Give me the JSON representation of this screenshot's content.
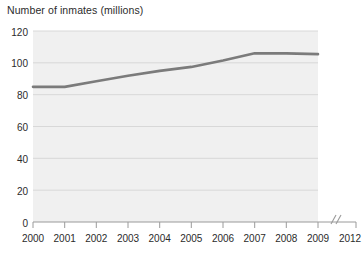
{
  "chart_data": {
    "type": "line",
    "title": "Number of inmates (millions)",
    "xlabel": "",
    "ylabel": "",
    "ylim": [
      0,
      120
    ],
    "ytick_labels": [
      "0",
      "20",
      "40",
      "60",
      "80",
      "100",
      "120"
    ],
    "yticks": [
      0,
      20,
      40,
      60,
      80,
      100,
      120
    ],
    "xtick_labels": [
      "2000",
      "2001",
      "2002",
      "2003",
      "2004",
      "2005",
      "2006",
      "2007",
      "2008",
      "2009",
      "2012"
    ],
    "x": [
      2000,
      2001,
      2002,
      2003,
      2004,
      2005,
      2006,
      2007,
      2008,
      2009
    ],
    "values": [
      85,
      85,
      88.5,
      92,
      95,
      97.5,
      101.5,
      106,
      106,
      105.5
    ],
    "series": [
      {
        "name": "Number of inmates",
        "values": [
          85,
          85,
          88.5,
          92,
          95,
          97.5,
          101.5,
          106,
          106,
          105.5
        ]
      }
    ],
    "grid": true,
    "grid_axis": "y",
    "legend": false,
    "legend_position": "none",
    "axis_break": {
      "present": true,
      "symbol": "//",
      "between": [
        "2009",
        "2012"
      ]
    },
    "colors": {
      "line": "#7b7b7b",
      "plot_background": "#f0f0f0",
      "gridline": "#d8d8d8",
      "axis": "#9a9a9a",
      "text": "#2b2b2b",
      "page_background": "#ffffff"
    }
  }
}
